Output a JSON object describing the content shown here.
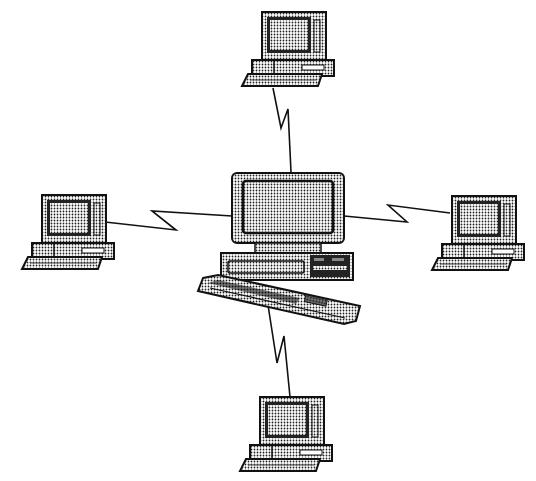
{
  "diagram": {
    "type": "star-network-topology",
    "background": "#ffffff",
    "colors": {
      "ink": "#111111",
      "screen_fill": "#9a9a9a",
      "case_fill": "#bdbdbd"
    },
    "hub": {
      "name": "central-computer",
      "x": 226,
      "y": 172
    },
    "nodes": [
      {
        "name": "terminal-top",
        "x": 232,
        "y": 10
      },
      {
        "name": "terminal-left",
        "x": 20,
        "y": 195
      },
      {
        "name": "terminal-right",
        "x": 430,
        "y": 195
      },
      {
        "name": "terminal-bottom",
        "x": 232,
        "y": 396
      }
    ],
    "links": [
      {
        "name": "link-top",
        "points": "273,88 281,128 288,109 291,172"
      },
      {
        "name": "link-left",
        "points": "105,222 172,228 152,211 232,216"
      },
      {
        "name": "link-right",
        "points": "344,216 398,205 405,222 450,213"
      },
      {
        "name": "link-bottom",
        "points": "268,305 277,363 284,336 290,397"
      }
    ]
  }
}
